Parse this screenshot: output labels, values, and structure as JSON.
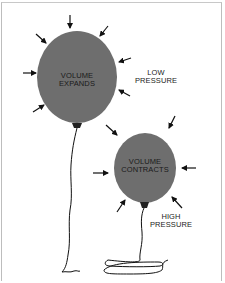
{
  "diagram": {
    "big_balloon": {
      "label_line1": "VOLUME",
      "label_line2": "EXPANDS",
      "pressure_line1": "LOW",
      "pressure_line2": "PRESSURE"
    },
    "small_balloon": {
      "label_line1": "VOLUME",
      "label_line2": "CONTRACTS",
      "pressure_line1": "HIGH",
      "pressure_line2": "PRESSURE"
    },
    "colors": {
      "balloon_fill": "#6e6e6e",
      "arrow": "#111111",
      "string": "#111111",
      "background": "#ffffff"
    }
  }
}
